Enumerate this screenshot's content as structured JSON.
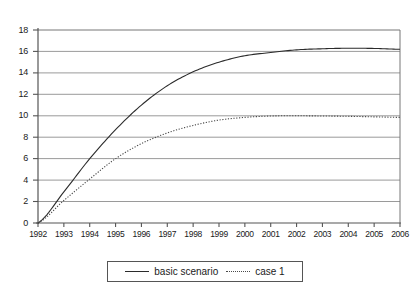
{
  "chart_data": {
    "type": "line",
    "title": "",
    "xlabel": "",
    "ylabel": "",
    "xlim": [
      1992,
      2006
    ],
    "ylim": [
      0,
      18
    ],
    "ytick_step": 2,
    "grid": true,
    "grid_orientation": "horizontal",
    "legend_position": "bottom-center",
    "x": [
      1992,
      1993,
      1994,
      1995,
      1996,
      1997,
      1998,
      1999,
      2000,
      2001,
      2002,
      2003,
      2004,
      2005,
      2006
    ],
    "xticklabels": [
      "1992",
      "1993",
      "1994",
      "1995",
      "1996",
      "1997",
      "1998",
      "1999",
      "2000",
      "2001",
      "2002",
      "2003",
      "2004",
      "2005",
      "2006"
    ],
    "yticklabels": [
      "0",
      "2",
      "4",
      "6",
      "8",
      "10",
      "12",
      "14",
      "16",
      "18"
    ],
    "yticks": [
      0,
      2,
      4,
      6,
      8,
      10,
      12,
      14,
      16,
      18
    ],
    "series": [
      {
        "name": "basic scenario",
        "style": "solid",
        "color": "#2b2b2b",
        "values": [
          0.0,
          2.9,
          6.0,
          8.7,
          11.0,
          12.8,
          14.1,
          15.0,
          15.6,
          15.9,
          16.15,
          16.25,
          16.3,
          16.28,
          16.2
        ]
      },
      {
        "name": "case 1",
        "style": "dotted",
        "color": "#4a4a4a",
        "values": [
          0.0,
          2.1,
          4.1,
          6.0,
          7.4,
          8.4,
          9.1,
          9.6,
          9.85,
          9.98,
          10.0,
          9.98,
          9.95,
          9.9,
          9.85
        ]
      }
    ],
    "legend": [
      {
        "label": "basic scenario",
        "style": "solid",
        "swatch_name": "legend-swatch-solid"
      },
      {
        "label": "case 1",
        "style": "dotted",
        "swatch_name": "legend-swatch-dotted"
      }
    ],
    "colors": {
      "axis": "#555555",
      "grid": "#777777",
      "background": "#ffffff",
      "series_basic": "#2b2b2b",
      "series_case1": "#4a4a4a"
    }
  }
}
